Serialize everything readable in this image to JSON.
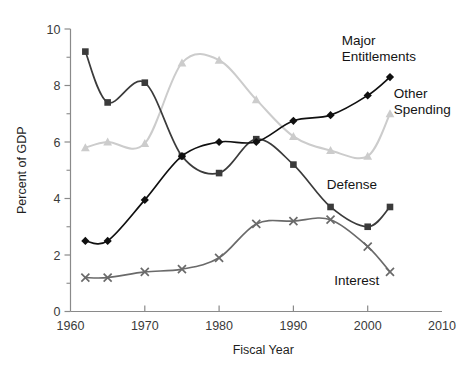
{
  "chart_data": {
    "type": "line",
    "title": "",
    "subtitle": "",
    "xlabel": "Fiscal Year",
    "ylabel": "Percent of GDP",
    "xlim": [
      1960,
      2010
    ],
    "ylim": [
      0,
      10
    ],
    "xticks": [
      1960,
      1970,
      1980,
      1990,
      2000,
      2010
    ],
    "xtick_labels": [
      "1960",
      "1970",
      "1980",
      "1990",
      "2000",
      "2010"
    ],
    "yticks": [
      0,
      2,
      4,
      6,
      8,
      10
    ],
    "ytick_labels": [
      "0",
      "2",
      "4",
      "6",
      "8",
      "10"
    ],
    "yticks_minor": [
      1,
      3,
      5,
      7,
      9
    ],
    "grid": false,
    "legend_position": "inline-end-of-line",
    "x": [
      1962,
      1965,
      1970,
      1975,
      1980,
      1985,
      1990,
      1995,
      2000,
      2003
    ],
    "series": [
      {
        "name": "Defense",
        "label": "Defense",
        "color": "#3b3b3b",
        "marker": "square",
        "label_x": 1994.5,
        "label_y": 4.35,
        "values": [
          9.2,
          7.4,
          8.1,
          5.5,
          4.9,
          6.1,
          5.2,
          3.7,
          3.0,
          3.7
        ]
      },
      {
        "name": "Major Entitlements",
        "label": "Major\nEntitlements",
        "color": "#101010",
        "marker": "diamond",
        "label_x": 1996.5,
        "label_y": 9.45,
        "values": [
          2.5,
          2.5,
          3.95,
          5.5,
          6.0,
          6.0,
          6.75,
          6.95,
          7.65,
          8.3
        ]
      },
      {
        "name": "Other Spending",
        "label": "Other\nSpending",
        "color": "#cccccc",
        "marker": "triangle",
        "label_x": 2003.5,
        "label_y": 7.55,
        "values": [
          5.8,
          6.0,
          5.95,
          8.8,
          8.9,
          7.5,
          6.2,
          5.7,
          5.5,
          7.0
        ]
      },
      {
        "name": "Interest",
        "label": "Interest",
        "color": "#6a6a6a",
        "marker": "cross",
        "label_x": 1995.5,
        "label_y": 0.95,
        "values": [
          1.2,
          1.2,
          1.4,
          1.5,
          1.9,
          3.1,
          3.2,
          3.25,
          2.3,
          1.4
        ]
      }
    ]
  },
  "figure": {
    "background": "#ffffff",
    "axis_color": "#8a8a8a",
    "text_color": "#1f1f1f"
  }
}
